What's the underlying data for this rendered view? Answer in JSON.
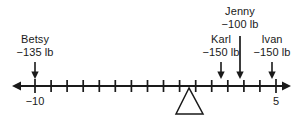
{
  "figure": {
    "kind": "number-line-balance-diagram"
  },
  "axis": {
    "min": -10,
    "max": 5,
    "tick_step": 1,
    "tick_count": 16,
    "left_arrow": true,
    "right_arrow": true,
    "labels": [
      {
        "text": "−10",
        "value": -10
      },
      {
        "text": "5",
        "value": 5
      }
    ]
  },
  "fulcrum": {
    "position": 0,
    "shape": "triangle"
  },
  "markers": [
    {
      "id": "betsy",
      "name": "Betsy",
      "weight": "−135 lb",
      "value": -10,
      "stem": "short"
    },
    {
      "id": "karl",
      "name": "Karl",
      "weight": "−150 lb",
      "value": 2,
      "stem": "short"
    },
    {
      "id": "jenny",
      "name": "Jenny",
      "weight": "−100 lb",
      "value": 3,
      "stem": "long"
    },
    {
      "id": "ivan",
      "name": "Ivan",
      "weight": "−150 lb",
      "value": 5,
      "stem": "short"
    }
  ]
}
